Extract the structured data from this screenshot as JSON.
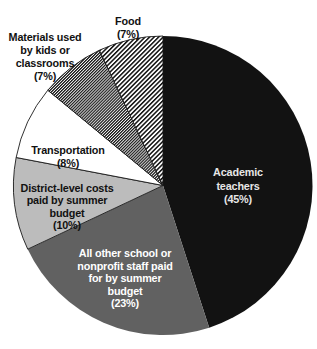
{
  "figure": {
    "background": "#ffffff",
    "width": 317,
    "height": 349
  },
  "chart_data": {
    "type": "pie",
    "title": "",
    "legend": "none",
    "center_x": 163,
    "center_y": 185.5,
    "radius": 149.5,
    "start_angle_deg": 0,
    "direction": "clockwise",
    "outline_color": "#1a1a1a",
    "segments": [
      {
        "id": "academic-teachers",
        "label": "Academic teachers",
        "percent": 45,
        "fill": "#121212",
        "stroke": "none",
        "label_lines": [
          "Academic",
          "teachers",
          "(45%)"
        ],
        "label_x": 238,
        "label_y": 176,
        "line_height": 13.5,
        "text_color": "#e6e6e6"
      },
      {
        "id": "other-staff",
        "label": "All other school or nonprofit staff paid for by summer budget",
        "percent": 23,
        "fill": "#616161",
        "stroke": "none",
        "label_lines": [
          "All other school or",
          "nonprofit staff paid",
          "for by summer",
          "budget",
          "(23%)"
        ],
        "label_x": 125,
        "label_y": 257,
        "line_height": 12.5,
        "text_color": "#ffffff"
      },
      {
        "id": "district-costs",
        "label": "District-level costs paid by summer budget",
        "percent": 10,
        "fill": "#bcbcbc",
        "stroke": "#1a1a1a",
        "label_lines": [
          "District-level costs",
          "paid by summer",
          "budget",
          "(10%)"
        ],
        "label_x": 67,
        "label_y": 192,
        "line_height": 12.4,
        "text_color": "#111111"
      },
      {
        "id": "transportation",
        "label": "Transportation",
        "percent": 8,
        "fill": "#ffffff",
        "stroke": "#1a1a1a",
        "label_lines": [
          "Transportation",
          "(8%)"
        ],
        "label_x": 68,
        "label_y": 154,
        "line_height": 13,
        "text_color": "#111111"
      },
      {
        "id": "materials",
        "label": "Materials used by kids or classrooms",
        "percent": 7,
        "fill": "pattern:hatch-dense",
        "stroke": "#1a1a1a",
        "label_lines": [
          "Materials used",
          "by kids or",
          "classrooms",
          "(7%)"
        ],
        "label_x": 45,
        "label_y": 41,
        "line_height": 13,
        "text_color": "#111111"
      },
      {
        "id": "food",
        "label": "Food",
        "percent": 7,
        "fill": "pattern:hatch-stripe",
        "stroke": "#1a1a1a",
        "label_lines": [
          "Food",
          "(7%)"
        ],
        "label_x": 128,
        "label_y": 25,
        "line_height": 13,
        "text_color": "#111111"
      }
    ]
  }
}
